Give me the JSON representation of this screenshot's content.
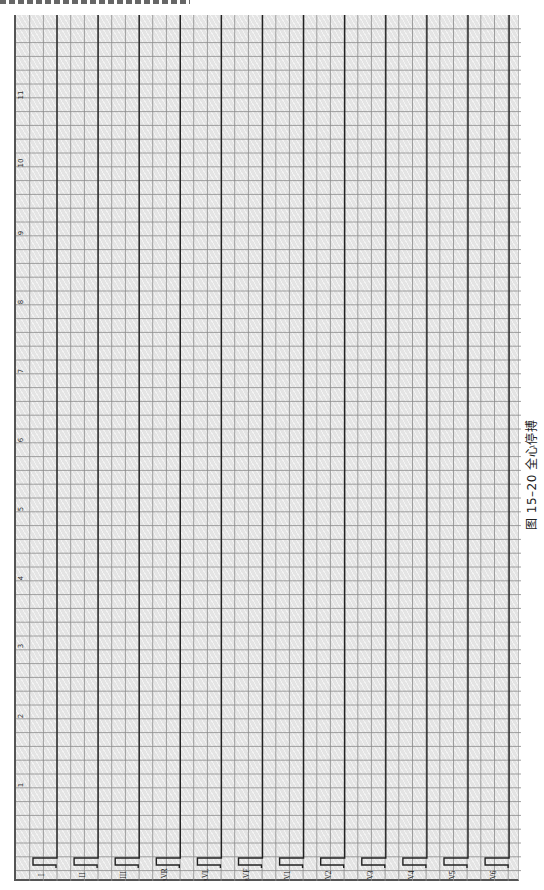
{
  "figure": {
    "caption": "图 15–20  全心停搏",
    "caption_number": "图 15–20",
    "caption_title": "全心停搏"
  },
  "ecg": {
    "grid": {
      "background": "#e4e4e4",
      "line_color": "#8a8a8a",
      "trace_color": "#222222"
    },
    "time_ticks": [
      "1",
      "2",
      "3",
      "4",
      "5",
      "6",
      "7",
      "8",
      "9",
      "10",
      "11"
    ],
    "leads": [
      "I",
      "II",
      "III",
      "aVR",
      "aVL",
      "aVF",
      "V1",
      "V2",
      "V3",
      "V4",
      "V5",
      "V6"
    ],
    "rhythm": "flat line (asystole) in all 12 leads"
  }
}
